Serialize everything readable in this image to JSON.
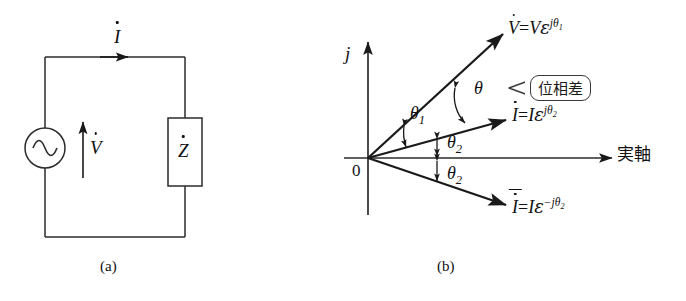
{
  "figure": {
    "circuit": {
      "caption": "(a)",
      "source_icon": "ac-source-icon",
      "current_label": {
        "symbol": "I",
        "accent": "dot"
      },
      "voltage_label": {
        "symbol": "V",
        "accent": "dot"
      },
      "impedance_label": {
        "symbol": "Z",
        "accent": "dot"
      }
    },
    "phasor": {
      "caption": "(b)",
      "imag_axis_label": "j",
      "real_axis_label": "実軸",
      "origin_label": "0",
      "callout_text": "位相差",
      "angles": [
        {
          "name": "theta-1",
          "base": "θ",
          "sub": "1"
        },
        {
          "name": "theta-phase",
          "base": "θ",
          "sub": ""
        },
        {
          "name": "theta-2-upper",
          "base": "θ",
          "sub": "2"
        },
        {
          "name": "theta-2-lower",
          "base": "θ",
          "sub": "2"
        }
      ],
      "vectors": [
        {
          "name": "voltage-phasor",
          "lhs": "V",
          "lhs_accent": "dot",
          "equals": "=",
          "magnitude": "V",
          "base": "ε",
          "exponent": "jθ",
          "exponent_sub": "1"
        },
        {
          "name": "current-phasor",
          "lhs": "I",
          "lhs_accent": "dot",
          "equals": "=",
          "magnitude": "I",
          "base": "ε",
          "exponent": "jθ",
          "exponent_sub": "2"
        },
        {
          "name": "conjugate-current-phasor",
          "lhs": "I",
          "lhs_accent": "dot-bar",
          "equals": "=",
          "magnitude": "I",
          "base": "ε",
          "exponent": "−jθ",
          "exponent_sub": "2"
        }
      ]
    }
  },
  "colors": {
    "ink": "#111111",
    "line": "#2b2b2b",
    "background": "#ffffff"
  }
}
